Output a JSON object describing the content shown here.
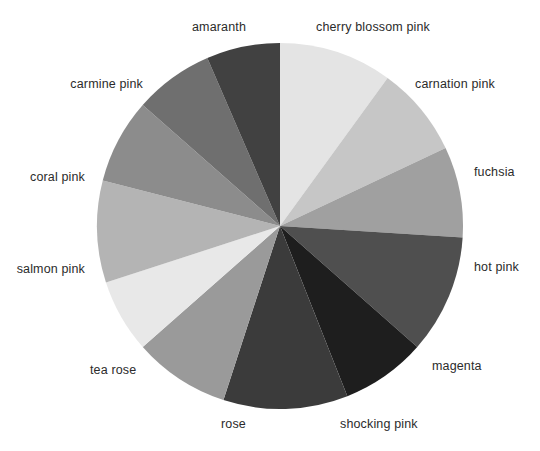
{
  "chart_data": {
    "type": "pie",
    "title": "",
    "subtitle": "",
    "xlabel": "",
    "ylabel": "",
    "legend_position": "none",
    "grid": false,
    "labels_placement": "outside-radial",
    "start_angle_deg": 90,
    "direction": "clockwise",
    "center_px": [
      280,
      226
    ],
    "radius_px": 183,
    "categories": [
      "cherry blossom pink",
      "carnation pink",
      "fuchsia",
      "hot pink",
      "magenta",
      "shocking pink",
      "rose",
      "tea rose",
      "salmon pink",
      "coral pink",
      "carmine pink",
      "amaranth"
    ],
    "values": [
      10.0,
      8.0,
      8.0,
      10.5,
      7.5,
      11.0,
      8.5,
      6.5,
      9.0,
      7.5,
      7.0,
      6.5
    ],
    "slice_colors": [
      "#e4e4e4",
      "#c6c6c6",
      "#a0a0a0",
      "#4f4f4f",
      "#1e1e1e",
      "#3b3b3b",
      "#9a9a9a",
      "#e8e8e8",
      "#b4b4b4",
      "#8c8c8c",
      "#6f6f6f",
      "#414141"
    ],
    "slices": [
      {
        "label": "cherry blossom pink",
        "value": 10.0,
        "color": "#e4e4e4",
        "start_deg": 0.0,
        "end_deg": 36.0,
        "label_x": 316,
        "label_y": 27,
        "anchor": "start"
      },
      {
        "label": "carnation pink",
        "value": 8.0,
        "color": "#c6c6c6",
        "start_deg": 36.0,
        "end_deg": 64.8,
        "label_x": 415,
        "label_y": 84,
        "anchor": "start"
      },
      {
        "label": "fuchsia",
        "value": 8.0,
        "color": "#a0a0a0",
        "start_deg": 64.8,
        "end_deg": 93.6,
        "label_x": 474,
        "label_y": 172,
        "anchor": "start"
      },
      {
        "label": "hot pink",
        "value": 10.5,
        "color": "#4f4f4f",
        "start_deg": 93.6,
        "end_deg": 131.4,
        "label_x": 474,
        "label_y": 267,
        "anchor": "start"
      },
      {
        "label": "magenta",
        "value": 7.5,
        "color": "#1e1e1e",
        "start_deg": 131.4,
        "end_deg": 158.4,
        "label_x": 432,
        "label_y": 366,
        "anchor": "start"
      },
      {
        "label": "shocking pink",
        "value": 11.0,
        "color": "#3b3b3b",
        "start_deg": 158.4,
        "end_deg": 198.0,
        "label_x": 340,
        "label_y": 424,
        "anchor": "start"
      },
      {
        "label": "rose",
        "value": 8.5,
        "color": "#9a9a9a",
        "start_deg": 198.0,
        "end_deg": 228.6,
        "label_x": 221,
        "label_y": 424,
        "anchor": "start"
      },
      {
        "label": "tea rose",
        "value": 6.5,
        "color": "#e8e8e8",
        "start_deg": 228.6,
        "end_deg": 252.0,
        "label_x": 90,
        "label_y": 370,
        "anchor": "start"
      },
      {
        "label": "salmon pink",
        "value": 9.0,
        "color": "#b4b4b4",
        "start_deg": 252.0,
        "end_deg": 284.4,
        "label_x": 85,
        "label_y": 269,
        "anchor": "end"
      },
      {
        "label": "coral pink",
        "value": 7.5,
        "color": "#8c8c8c",
        "start_deg": 284.4,
        "end_deg": 311.4,
        "label_x": 85,
        "label_y": 177,
        "anchor": "end"
      },
      {
        "label": "carmine pink",
        "value": 7.0,
        "color": "#6f6f6f",
        "start_deg": 311.4,
        "end_deg": 336.6,
        "label_x": 143,
        "label_y": 84,
        "anchor": "end"
      },
      {
        "label": "amaranth",
        "value": 6.5,
        "color": "#414141",
        "start_deg": 336.6,
        "end_deg": 360.0,
        "label_x": 246,
        "label_y": 27,
        "anchor": "end"
      }
    ]
  },
  "background_color": "#ffffff",
  "label_color": "#2b2b2b"
}
